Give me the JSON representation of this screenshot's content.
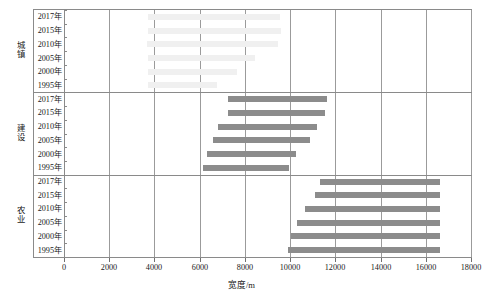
{
  "chart_data": {
    "type": "bar",
    "subtype": "horizontal-range-bar",
    "title": "",
    "xlabel": "宽度/m",
    "ylabel": "",
    "xlim": [
      0,
      18000
    ],
    "xticks": [
      0,
      2000,
      4000,
      6000,
      8000,
      10000,
      12000,
      14000,
      16000,
      18000
    ],
    "xtick_labels": [
      "0",
      "2000",
      "4000",
      "6000",
      "8000",
      "10000",
      "12000",
      "14000",
      "16000",
      "18000"
    ],
    "grid": true,
    "grid_axis": "x",
    "legend": "none",
    "categories": [
      "2017年",
      "2015年",
      "2010年",
      "2005年",
      "2000年",
      "1995年"
    ],
    "groups": [
      {
        "name": "城镇",
        "color": "#f0f0f0",
        "bars": [
          {
            "category": "2017年",
            "start": 3720,
            "end": 9560
          },
          {
            "category": "2015年",
            "start": 3720,
            "end": 9610
          },
          {
            "category": "2010年",
            "start": 3680,
            "end": 9480
          },
          {
            "category": "2005年",
            "start": 3700,
            "end": 8450
          },
          {
            "category": "2000年",
            "start": 3700,
            "end": 7640
          },
          {
            "category": "1995年",
            "start": 3700,
            "end": 6780
          }
        ]
      },
      {
        "name": "建设",
        "color": "#8c8c8c",
        "bars": [
          {
            "category": "2017年",
            "start": 7250,
            "end": 11620
          },
          {
            "category": "2015年",
            "start": 7250,
            "end": 11540
          },
          {
            "category": "2010年",
            "start": 6830,
            "end": 11180
          },
          {
            "category": "2005年",
            "start": 6610,
            "end": 10900
          },
          {
            "category": "2000年",
            "start": 6310,
            "end": 10250
          },
          {
            "category": "1995年",
            "start": 6160,
            "end": 9950
          }
        ]
      },
      {
        "name": "农业",
        "color": "#8c8c8c",
        "bars": [
          {
            "category": "2017年",
            "start": 11310,
            "end": 16630
          },
          {
            "category": "2015年",
            "start": 11100,
            "end": 16630
          },
          {
            "category": "2010年",
            "start": 10650,
            "end": 16630
          },
          {
            "category": "2005年",
            "start": 10320,
            "end": 16640
          },
          {
            "category": "2000年",
            "start": 10020,
            "end": 16630
          },
          {
            "category": "1995年",
            "start": 9900,
            "end": 16630
          }
        ]
      }
    ]
  }
}
